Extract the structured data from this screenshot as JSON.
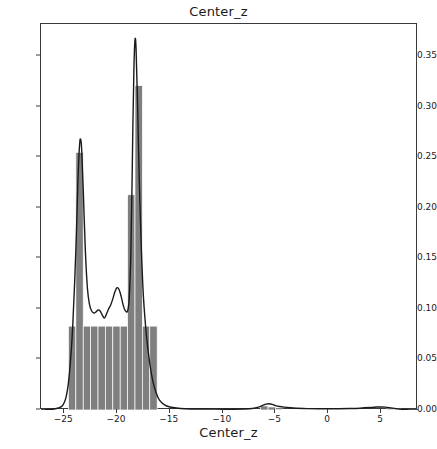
{
  "chart_data": {
    "type": "area",
    "title": "Center_z",
    "xlabel": "Center_z",
    "ylabel": "",
    "xlim": [
      -27.2,
      8.5
    ],
    "ylim": [
      0.0,
      0.382
    ],
    "grid": false,
    "legend": null,
    "series": [
      {
        "name": "histogram",
        "type": "bar",
        "fill_color": "#7f7f7f",
        "edge_color": "#ffffff",
        "bin_edges": [
          -24.6,
          -23.9,
          -23.2,
          -22.5,
          -21.8,
          -21.1,
          -20.4,
          -19.7,
          -19.0,
          -18.3,
          -17.6,
          -16.9,
          -16.2,
          -15.5,
          -14.8,
          -14.1,
          -13.4,
          -12.7,
          -12.0,
          -11.3,
          -10.6,
          -9.9,
          -9.2,
          -8.5,
          -7.8,
          -7.1,
          -6.4,
          -5.7,
          -5.0,
          -4.3,
          -3.6,
          -2.9,
          -2.2,
          -1.5,
          -0.8,
          -0.1,
          0.6,
          1.3,
          2.0,
          2.7,
          3.4,
          4.1,
          4.8,
          5.5,
          6.2,
          6.9
        ],
        "values": [
          0.083,
          0.255,
          0.083,
          0.083,
          0.083,
          0.083,
          0.083,
          0.083,
          0.213,
          0.321,
          0.083,
          0.083,
          0.0,
          0.0,
          0.0,
          0.0,
          0.0,
          0.0,
          0.0,
          0.0,
          0.0,
          0.0,
          0.0,
          0.0,
          0.0,
          0.0,
          0.004,
          0.003,
          0.001,
          0.0,
          0.0,
          0.0,
          0.0,
          0.0,
          0.0,
          0.0,
          0.0,
          0.0,
          0.0,
          0.0,
          0.0,
          0.0,
          0.0,
          0.001,
          0.001,
          0.0
        ]
      },
      {
        "name": "kde",
        "type": "line",
        "line_color": "#1a1a1a",
        "x": [
          -27.2,
          -26.0,
          -25.2,
          -24.8,
          -24.5,
          -24.2,
          -23.9,
          -23.7,
          -23.55,
          -23.45,
          -23.35,
          -23.2,
          -23.0,
          -22.8,
          -22.6,
          -22.4,
          -22.2,
          -22.0,
          -21.8,
          -21.6,
          -21.4,
          -21.2,
          -21.0,
          -20.8,
          -20.6,
          -20.4,
          -20.2,
          -20.0,
          -19.8,
          -19.6,
          -19.4,
          -19.2,
          -19.0,
          -18.85,
          -18.7,
          -18.6,
          -18.5,
          -18.4,
          -18.3,
          -18.2,
          -18.05,
          -17.9,
          -17.7,
          -17.5,
          -17.2,
          -16.9,
          -16.6,
          -16.3,
          -16.0,
          -15.5,
          -15.0,
          -14.0,
          -13.0,
          -12.0,
          -11.0,
          -10.0,
          -9.0,
          -8.0,
          -7.2,
          -6.6,
          -6.2,
          -5.9,
          -5.6,
          -5.3,
          -5.0,
          -4.6,
          -4.2,
          -3.6,
          -3.0,
          -2.0,
          -1.0,
          0.0,
          1.0,
          2.0,
          3.0,
          4.0,
          4.6,
          5.0,
          5.4,
          5.8,
          6.4,
          7.0,
          7.8,
          8.5
        ],
        "y": [
          0.0,
          0.001,
          0.004,
          0.014,
          0.037,
          0.082,
          0.158,
          0.228,
          0.262,
          0.268,
          0.258,
          0.218,
          0.158,
          0.12,
          0.104,
          0.098,
          0.096,
          0.097,
          0.099,
          0.098,
          0.094,
          0.091,
          0.095,
          0.1,
          0.104,
          0.11,
          0.117,
          0.121,
          0.119,
          0.112,
          0.103,
          0.098,
          0.098,
          0.11,
          0.152,
          0.21,
          0.28,
          0.338,
          0.366,
          0.358,
          0.3,
          0.23,
          0.16,
          0.112,
          0.072,
          0.046,
          0.028,
          0.017,
          0.01,
          0.005,
          0.003,
          0.0015,
          0.001,
          0.001,
          0.0009,
          0.0008,
          0.0008,
          0.001,
          0.0015,
          0.0028,
          0.0045,
          0.0058,
          0.0062,
          0.0056,
          0.0044,
          0.0034,
          0.0028,
          0.0022,
          0.0018,
          0.0014,
          0.0012,
          0.0012,
          0.0013,
          0.0015,
          0.0018,
          0.0024,
          0.0029,
          0.003,
          0.0028,
          0.0023,
          0.0014,
          0.0006,
          0.0001,
          0.0
        ]
      }
    ],
    "yticks": [
      0.0,
      0.05,
      0.1,
      0.15,
      0.2,
      0.25,
      0.3,
      0.35
    ],
    "ytick_labels": [
      "0.00",
      "0.05",
      "0.10",
      "0.15",
      "0.20",
      "0.25",
      "0.30",
      "0.35"
    ],
    "xticks": [
      -25,
      -20,
      -15,
      -10,
      -5,
      0,
      5
    ],
    "xtick_labels": [
      "−25",
      "−20",
      "−15",
      "−10",
      "−5",
      "0",
      "5"
    ]
  }
}
